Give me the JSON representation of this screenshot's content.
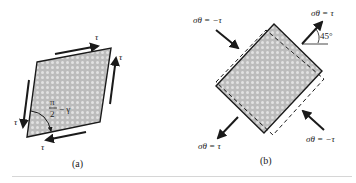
{
  "figure": {
    "panel_a": {
      "caption": "(a)",
      "shear_labels": [
        "τ",
        "τ",
        "τ",
        "τ"
      ],
      "angle_label": {
        "numerator": "π",
        "denominator": "2",
        "suffix": "− γ"
      }
    },
    "panel_b": {
      "caption": "(b)",
      "stress_labels": {
        "top_left": "σθ = −τ",
        "top_right": "σθ = τ",
        "bottom_left": "σθ = τ",
        "bottom_right": "σθ = −τ"
      },
      "angle_label": "45°"
    },
    "colors": {
      "fill": "#b9b9b9",
      "fill_dot": "#d8d8d8",
      "stroke": "#1a1a1a",
      "rule": "#d6d6d6"
    }
  }
}
